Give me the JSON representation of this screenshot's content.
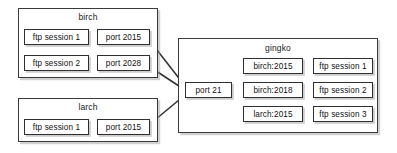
{
  "diagram": {
    "type": "network-ftp-session-diagram",
    "background_color": "#ffffff",
    "line_color": "#2f2f2f",
    "hosts": [
      {
        "id": "birch",
        "label": "birch",
        "rows": [
          {
            "session": "ftp session 1",
            "port": "port 2015"
          },
          {
            "session": "ftp session 2",
            "port": "port 2028"
          }
        ]
      },
      {
        "id": "larch",
        "label": "larch",
        "rows": [
          {
            "session": "ftp session 1",
            "port": "port 2015"
          }
        ]
      },
      {
        "id": "gingko",
        "label": "gingko",
        "listen_port": "port 21",
        "rows": [
          {
            "peer": "birch:2015",
            "session": "ftp session 1"
          },
          {
            "peer": "birch:2018",
            "session": "ftp session 2"
          },
          {
            "peer": "larch:2015",
            "session": "ftp session 3"
          }
        ]
      }
    ],
    "connections": [
      {
        "from": "birch / port 2015",
        "to": "gingko / port 21"
      },
      {
        "from": "birch / port 2028",
        "to": "gingko / port 21"
      },
      {
        "from": "larch / port 2015",
        "to": "gingko / port 21"
      },
      {
        "from": "gingko / port 21",
        "to": "gingko / birch:2015"
      },
      {
        "from": "gingko / port 21",
        "to": "gingko / birch:2018"
      },
      {
        "from": "gingko / port 21",
        "to": "gingko / larch:2015"
      }
    ]
  }
}
